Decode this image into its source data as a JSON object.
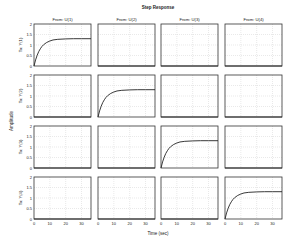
{
  "chart_data": {
    "type": "line",
    "title": "Step Response",
    "xlabel": "Time (sec)",
    "ylabel": "Amplitude",
    "xlim": [
      0,
      36
    ],
    "ylim": [
      0,
      2
    ],
    "xticks": [
      0,
      10,
      20,
      30
    ],
    "xtick_labels": [
      "0",
      "10",
      "20",
      "30"
    ],
    "yticks": [
      0,
      0.5,
      1,
      1.5,
      2
    ],
    "ytick_labels": [
      "0",
      "0.5",
      "1",
      "1.5",
      "2"
    ],
    "grid": true,
    "inputs": [
      "From: U(1)",
      "From: U(2)",
      "From: U(3)",
      "From: U(4)"
    ],
    "outputs": [
      "To: Y(1)",
      "To: Y(2)",
      "To: Y(3)",
      "To: Y(4)"
    ],
    "step_response": {
      "t": [
        0,
        1,
        2,
        3,
        4,
        5,
        6,
        8,
        10,
        12,
        15,
        20,
        25,
        30,
        36
      ],
      "y": [
        0,
        0.29,
        0.51,
        0.69,
        0.82,
        0.93,
        1.01,
        1.12,
        1.19,
        1.24,
        1.27,
        1.29,
        1.3,
        1.3,
        1.3
      ],
      "final_value": 1.3
    },
    "series": [
      {
        "name": "U(1)->Y(1)",
        "row": 0,
        "col": 0,
        "type": "step"
      },
      {
        "name": "U(2)->Y(1)",
        "row": 0,
        "col": 1,
        "type": "zero"
      },
      {
        "name": "U(3)->Y(1)",
        "row": 0,
        "col": 2,
        "type": "zero"
      },
      {
        "name": "U(4)->Y(1)",
        "row": 0,
        "col": 3,
        "type": "zero"
      },
      {
        "name": "U(1)->Y(2)",
        "row": 1,
        "col": 0,
        "type": "zero"
      },
      {
        "name": "U(2)->Y(2)",
        "row": 1,
        "col": 1,
        "type": "step"
      },
      {
        "name": "U(3)->Y(2)",
        "row": 1,
        "col": 2,
        "type": "zero"
      },
      {
        "name": "U(4)->Y(2)",
        "row": 1,
        "col": 3,
        "type": "zero"
      },
      {
        "name": "U(1)->Y(3)",
        "row": 2,
        "col": 0,
        "type": "zero"
      },
      {
        "name": "U(2)->Y(3)",
        "row": 2,
        "col": 1,
        "type": "zero"
      },
      {
        "name": "U(3)->Y(3)",
        "row": 2,
        "col": 2,
        "type": "step"
      },
      {
        "name": "U(4)->Y(3)",
        "row": 2,
        "col": 3,
        "type": "zero"
      },
      {
        "name": "U(1)->Y(4)",
        "row": 3,
        "col": 0,
        "type": "zero"
      },
      {
        "name": "U(2)->Y(4)",
        "row": 3,
        "col": 1,
        "type": "zero"
      },
      {
        "name": "U(3)->Y(4)",
        "row": 3,
        "col": 2,
        "type": "zero"
      },
      {
        "name": "U(4)->Y(4)",
        "row": 3,
        "col": 3,
        "type": "step"
      }
    ]
  }
}
